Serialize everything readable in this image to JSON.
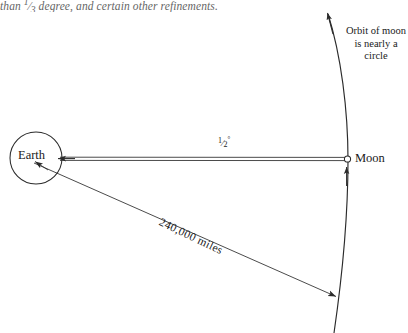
{
  "page": {
    "width": 408,
    "height": 333,
    "background": "#ffffff",
    "ink": "#1a1a1a"
  },
  "running_text": {
    "before_fraction": "than ",
    "fraction_numerator": "1",
    "fraction_denominator": "3",
    "after_fraction": " degree, and certain other refinements."
  },
  "figure": {
    "title_implicit": "Earth-Moon distance and angular size diagram",
    "labels": {
      "earth": "Earth",
      "moon": "Moon",
      "orbit_note": "Orbit of moon is nearly a circle",
      "orbit_note_lines": [
        "Orbit of moon",
        "is nearly a",
        "circle"
      ],
      "angular_size_numerator": "1",
      "angular_size_denominator": "2",
      "angular_size_degree_symbol": "°",
      "distance": "240,000 miles"
    },
    "geometry": {
      "earth_center_x": 36,
      "earth_center_y": 158,
      "earth_radius": 26,
      "moon_x": 347,
      "moon_y": 159,
      "moon_radius": 3,
      "orbit_arc_top_x": 327,
      "orbit_arc_top_y": 12,
      "orbit_arc_bottom_x": 345,
      "orbit_arc_bottom_y": 333,
      "wedge_tip_x": 57,
      "wedge_tip_y": 158,
      "distance_line_start_x": 34,
      "distance_line_start_y": 163,
      "distance_line_end_x": 337,
      "distance_line_end_y": 297
    },
    "colors": {
      "stroke": "#2b2b2b",
      "arc_stroke": "#2b2b2b",
      "fill": "none"
    }
  }
}
